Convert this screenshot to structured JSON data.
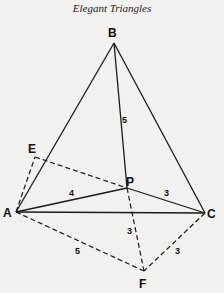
{
  "title": "Elegant Triangles",
  "diagram": {
    "points": {
      "A": {
        "label": "A",
        "x": 16,
        "y": 212
      },
      "B": {
        "label": "B",
        "x": 114,
        "y": 43
      },
      "C": {
        "label": "C",
        "x": 205,
        "y": 213
      },
      "P": {
        "label": "P",
        "x": 127,
        "y": 188
      },
      "E": {
        "label": "E",
        "x": 35,
        "y": 157
      },
      "F": {
        "label": "F",
        "x": 144,
        "y": 271
      }
    },
    "solid_segments": [
      "AB",
      "BC",
      "AC",
      "BP",
      "AP",
      "PC"
    ],
    "dashed_segments": [
      "AE",
      "EP",
      "PF",
      "AF",
      "CF"
    ],
    "lengths": {
      "BP": "5",
      "AP": "4",
      "PC": "3",
      "PF": "3",
      "AF": "5",
      "CF": "3"
    }
  }
}
